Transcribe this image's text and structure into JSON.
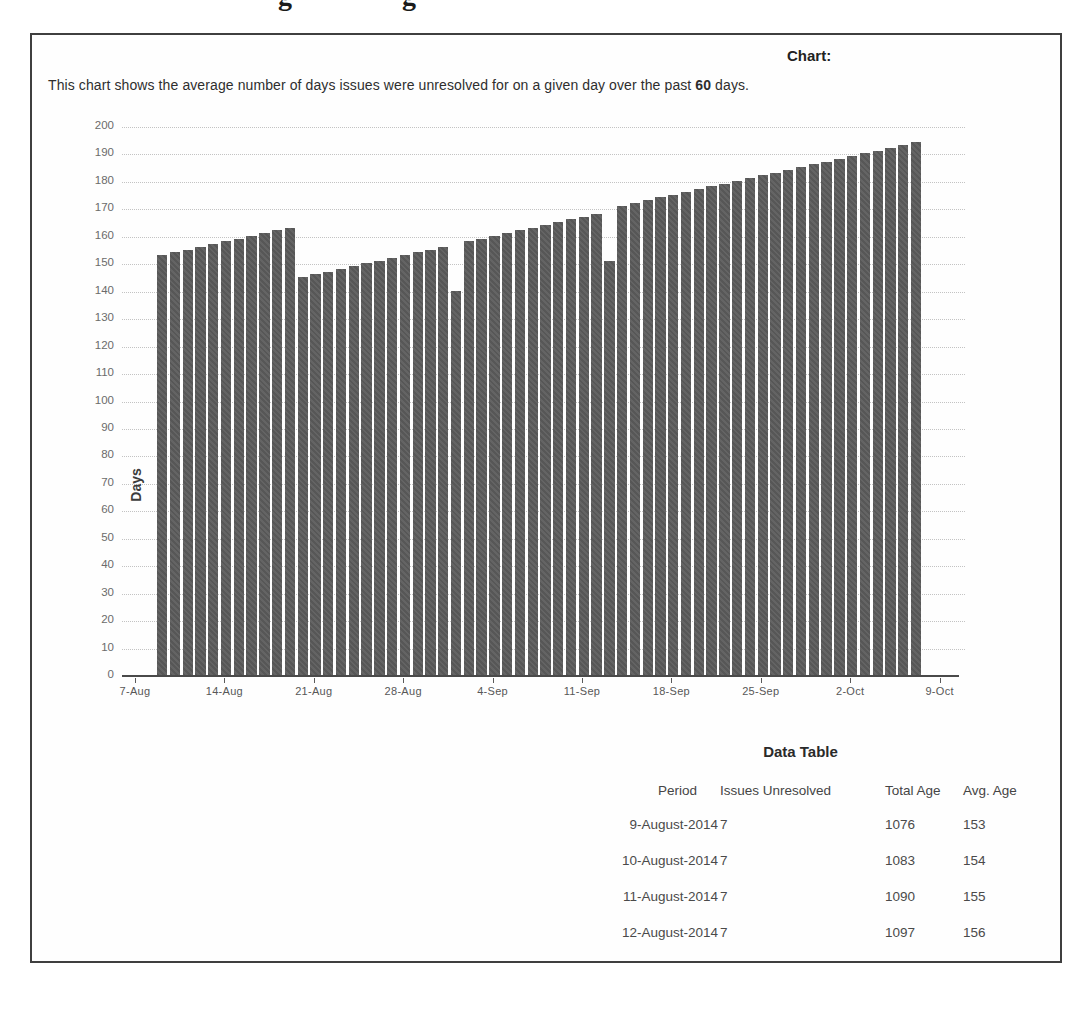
{
  "page": {
    "clipped_heading_fragments": [
      "g",
      "g"
    ]
  },
  "report": {
    "chart_label": "Chart:",
    "description": {
      "prefix": "This chart shows the average number of days issues were unresolved for on a given day over the past ",
      "bold": "60",
      "suffix": " days."
    }
  },
  "chart_data": {
    "type": "bar",
    "title": "Chart:",
    "ylabel": "Days",
    "ylim": [
      0,
      200
    ],
    "ytick_step": 10,
    "grid": "horizontal-dotted",
    "legend": "none",
    "bar_color": "#5d5d5d",
    "x_tick_labels": [
      "7-Aug",
      "14-Aug",
      "21-Aug",
      "28-Aug",
      "4-Sep",
      "11-Sep",
      "18-Sep",
      "25-Sep",
      "2-Oct",
      "9-Oct"
    ],
    "values": [
      153,
      154,
      155,
      156,
      157,
      158,
      159,
      160,
      161,
      162,
      163,
      145,
      146,
      147,
      148,
      149,
      150,
      151,
      152,
      153,
      154,
      155,
      156,
      140,
      158,
      159,
      160,
      161,
      162,
      163,
      164,
      165,
      166,
      167,
      168,
      151,
      171,
      172,
      173,
      174,
      175,
      176,
      177,
      178,
      179,
      180,
      181,
      182,
      183,
      184,
      185,
      186,
      187,
      188,
      189,
      190,
      191,
      192,
      193,
      194
    ]
  },
  "data_table": {
    "title": "Data Table",
    "columns": [
      "Period",
      "Issues Unresolved",
      "Total Age",
      "Avg. Age"
    ],
    "rows": [
      [
        "9-August-2014",
        "7",
        "1076",
        "153"
      ],
      [
        "10-August-2014",
        "7",
        "1083",
        "154"
      ],
      [
        "11-August-2014",
        "7",
        "1090",
        "155"
      ],
      [
        "12-August-2014",
        "7",
        "1097",
        "156"
      ]
    ]
  }
}
